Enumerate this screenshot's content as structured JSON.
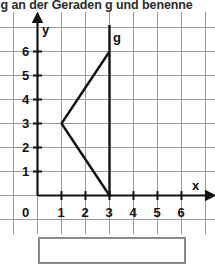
{
  "task": {
    "instruction_text": "ug an der Geraden g und benenne"
  },
  "plot": {
    "axis_labels": {
      "x": "x",
      "y": "y"
    },
    "x_ticks": [
      "1",
      "2",
      "3",
      "4",
      "5",
      "6"
    ],
    "y_ticks": [
      "1",
      "2",
      "3",
      "4",
      "5",
      "6"
    ],
    "origin_label": "0",
    "line_label_g": "g",
    "colors": {
      "grid": "#9a9a9a",
      "axis": "#111111",
      "shape": "#111111",
      "line_g": "#111111",
      "box_border": "#8a8a8a",
      "background": "#ffffff",
      "text": "#111111"
    },
    "geometry": {
      "x_range": [
        -1,
        7
      ],
      "y_range": [
        -1,
        7
      ],
      "unit_px": 24,
      "mirror_line_g": {
        "type": "vertical",
        "x": 3
      },
      "polyline_shape": [
        {
          "x": 3,
          "y": 6
        },
        {
          "x": 1,
          "y": 3
        },
        {
          "x": 3,
          "y": 0
        }
      ]
    }
  },
  "answer": {
    "value": "",
    "placeholder": ""
  }
}
